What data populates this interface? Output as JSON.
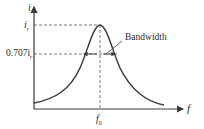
{
  "diagram": {
    "type": "resonance-curve",
    "y_axis_label": "i",
    "x_axis_label": "f",
    "peak_label": "i",
    "peak_label_sub": "r",
    "half_power_label": "0.707i",
    "half_power_label_sub": "r",
    "center_freq_label": "f",
    "center_freq_label_sub": "0",
    "bandwidth_label": "Bandwidth",
    "colors": {
      "curve": "#3a3a3a",
      "axes": "#3a3a3a",
      "dashed": "#555555",
      "text": "#2a2a2a",
      "background": "#ffffff"
    }
  }
}
